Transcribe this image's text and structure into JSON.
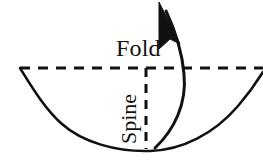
{
  "figure": {
    "background_color": "#ffffff",
    "stroke_color": "#111111",
    "width": 263,
    "height": 166
  },
  "labels": {
    "fold": "Fold",
    "spine": "Spine"
  },
  "icons": {
    "arrow": "curved-up-arrow-icon",
    "bowl": "open-book-cross-section-icon",
    "fold_line": "horizontal-dashed-line-icon",
    "spine_line": "vertical-dashed-line-icon"
  },
  "geometry": {
    "fold_line": {
      "x1": 20,
      "y1": 68,
      "x2": 263,
      "y2": 68,
      "dash": "9 7",
      "width": 3
    },
    "spine_line": {
      "x1": 146,
      "y1": 68,
      "x2": 146,
      "y2": 149,
      "dash": "9 7",
      "width": 3
    },
    "bowl_path": "M 20,68 C 38,92 58,124 84,140 C 110,153 150,155 184,146 C 214,138 240,112 263,72",
    "bowl_stroke_width": 2.6,
    "arrow_curve": "M 155,148 C 176,128 188,96 181,56 C 177,34 170,18 164,8",
    "arrow_stroke_width": 3,
    "arrow_head_points": "160,3 176,38 168,36 157,45"
  }
}
